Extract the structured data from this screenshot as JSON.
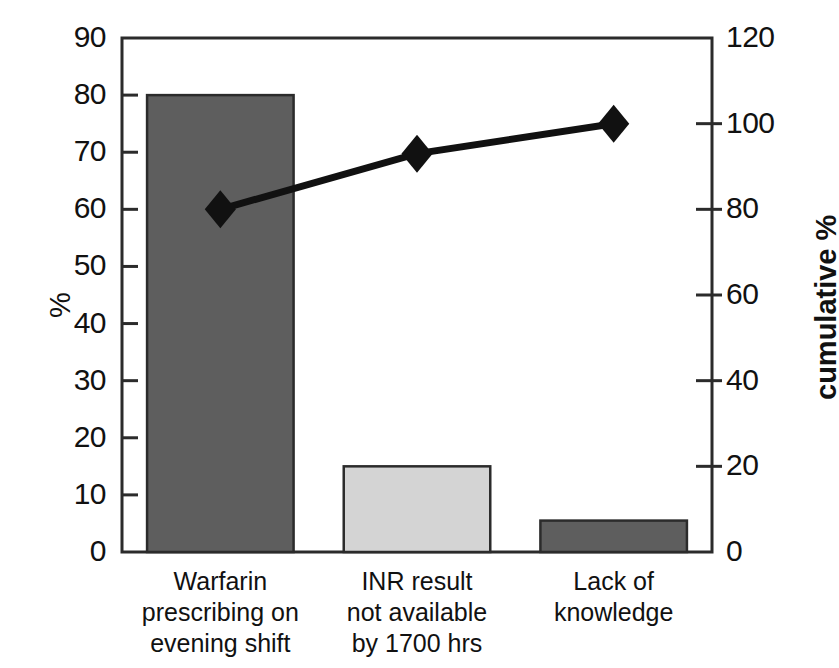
{
  "chart_data": {
    "type": "bar",
    "title": "",
    "subtitle": "",
    "xlabel": "",
    "ylabel": "%",
    "y2label": "cumulative %",
    "categories": [
      "Warfarin prescribing on evening shift",
      "INR result not available by 1700 hrs",
      "Lack of knowledge"
    ],
    "category_lines": [
      [
        "Warfarin",
        "prescribing on",
        "evening shift"
      ],
      [
        "INR result",
        "not available",
        "by 1700 hrs"
      ],
      [
        "Lack of",
        "knowledge"
      ]
    ],
    "values": [
      80,
      15,
      5.5
    ],
    "bar_colors": [
      "#5e5e5e",
      "#d4d4d4",
      "#5e5e5e"
    ],
    "bar_edge_color": "#2b2b2b",
    "series": [
      {
        "name": "%",
        "axis": "left",
        "values": [
          80,
          15,
          5.5
        ]
      },
      {
        "name": "cumulative %",
        "axis": "right",
        "values": [
          80,
          93,
          100
        ]
      }
    ],
    "ylim": [
      0,
      90
    ],
    "yticks": [
      0,
      10,
      20,
      30,
      40,
      50,
      60,
      70,
      80,
      90
    ],
    "y2lim": [
      0,
      120
    ],
    "y2ticks": [
      0,
      20,
      40,
      60,
      80,
      100,
      120
    ],
    "grid": false,
    "legend": "none",
    "line_color": "#111111",
    "marker": "diamond",
    "marker_color": "#111111"
  },
  "axes": {
    "left_ticks": [
      "90",
      "80",
      "70",
      "60",
      "50",
      "40",
      "30",
      "20",
      "10",
      "0"
    ],
    "right_ticks": [
      "120",
      "100",
      "80",
      "60",
      "40",
      "20",
      "0"
    ],
    "left_title": "%",
    "right_title": "cumulative %"
  }
}
